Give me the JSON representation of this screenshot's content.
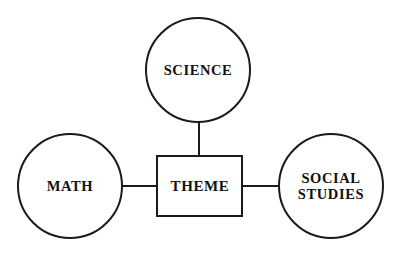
{
  "diagram": {
    "type": "concept-web",
    "background_color": "#ffffff",
    "stroke_color": "#1a1a1a",
    "text_color": "#111111",
    "center": {
      "id": "theme",
      "shape": "rectangle",
      "label": "THEME",
      "x": 157,
      "y": 156,
      "width": 86,
      "height": 61
    },
    "nodes": [
      {
        "id": "science",
        "shape": "circle",
        "label_lines": [
          "SCIENCE"
        ],
        "cx": 198,
        "cy": 70,
        "r": 52
      },
      {
        "id": "math",
        "shape": "circle",
        "label_lines": [
          "MATH"
        ],
        "cx": 70,
        "cy": 186,
        "r": 52
      },
      {
        "id": "social-studies",
        "shape": "circle",
        "label_lines": [
          "SOCIAL",
          "STUDIES"
        ],
        "cx": 331,
        "cy": 186,
        "r": 52
      }
    ],
    "connectors": [
      {
        "id": "science-to-theme",
        "orientation": "vertical",
        "x1": 199,
        "y1": 122,
        "x2": 199,
        "y2": 157
      },
      {
        "id": "math-to-theme",
        "orientation": "horizontal",
        "x1": 122,
        "y1": 186,
        "x2": 158,
        "y2": 186
      },
      {
        "id": "theme-to-social-studies",
        "orientation": "horizontal",
        "x1": 242,
        "y1": 186,
        "x2": 278,
        "y2": 186
      }
    ]
  },
  "labels": {
    "science": "SCIENCE",
    "math": "MATH",
    "theme": "THEME",
    "social_line1": "SOCIAL",
    "social_line2": "STUDIES"
  }
}
